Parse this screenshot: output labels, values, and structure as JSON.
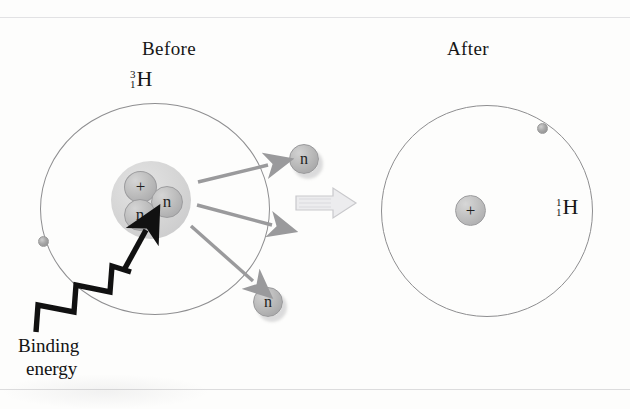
{
  "figure": {
    "type": "physics-diagram",
    "panels": {
      "before": {
        "caption": "Before",
        "isotope": {
          "mass_number": "3",
          "atomic_number": "1",
          "symbol": "H"
        },
        "nucleus": {
          "nucleons": [
            {
              "name": "proton",
              "label": "+"
            },
            {
              "name": "neutron",
              "label": "n"
            },
            {
              "name": "neutron",
              "label": "n"
            }
          ]
        },
        "electron_label": "e"
      },
      "after": {
        "caption": "After",
        "isotope": {
          "mass_number": "1",
          "atomic_number": "1",
          "symbol": "H"
        },
        "nucleus": {
          "nucleons": [
            {
              "name": "proton",
              "label": "+"
            }
          ]
        },
        "electron_label": "e"
      }
    },
    "ejected_particles": [
      {
        "name": "neutron",
        "label": "n",
        "position": "upper-right"
      },
      {
        "name": "neutron",
        "label": "n",
        "position": "lower-right"
      }
    ],
    "energy_input": {
      "label_line_1": "Binding",
      "label_line_2": "energy",
      "arrow_style": "zigzag",
      "color": "#111111"
    },
    "transition_arrow": {
      "direction": "right",
      "style": "hollow-block",
      "color": "#d6d6d8"
    },
    "ejection_arrows": {
      "count": 3,
      "color": "#9a9a9c"
    },
    "colors": {
      "background": "#fdfdfc",
      "orbit_stroke": "#8e8e90",
      "nucleon_fill": "#bcbcbc",
      "nucleus_halo": "#d1d1d1",
      "text": "#161616",
      "electron": "#a8a8a8"
    }
  }
}
